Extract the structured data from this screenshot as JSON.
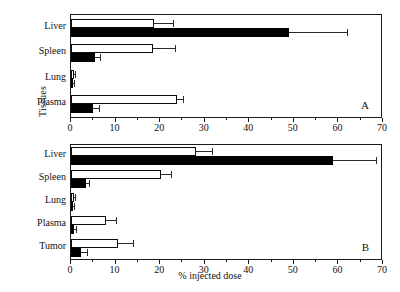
{
  "chart_data": {
    "type": "bar",
    "orientation": "horizontal",
    "title": "",
    "xlabel": "% injected dose",
    "ylabel": "Tissues",
    "xlim": [
      0,
      70
    ],
    "xticks": [
      0,
      10,
      20,
      30,
      40,
      50,
      60,
      70
    ],
    "xtick_labels": [
      "0",
      "10",
      "20",
      "30",
      "40",
      "50",
      "60",
      "70"
    ],
    "grid": false,
    "legend": null,
    "panels": [
      {
        "letter": "A",
        "categories": [
          "Liver",
          "Spleen",
          "Lung",
          "Plasma"
        ],
        "series": [
          {
            "name": "open",
            "style": "open",
            "values": [
              18.6,
              18.3,
              0.7,
              23.7
            ],
            "errors": [
              4.3,
              5.0,
              0.3,
              1.4
            ]
          },
          {
            "name": "filled",
            "style": "filled",
            "values": [
              49.0,
              5.3,
              0.3,
              5.0
            ],
            "errors": [
              13.0,
              1.3,
              0.2,
              1.2
            ]
          }
        ]
      },
      {
        "letter": "B",
        "categories": [
          "Liver",
          "Spleen",
          "Lung",
          "Plasma",
          "Tumor"
        ],
        "series": [
          {
            "name": "open",
            "style": "open",
            "values": [
              28.0,
              20.1,
              0.6,
              7.8,
              10.5
            ],
            "errors": [
              3.6,
              2.4,
              0.3,
              2.2,
              3.5
            ]
          },
          {
            "name": "filled",
            "style": "filled",
            "values": [
              58.7,
              3.4,
              0.4,
              0.7,
              2.3
            ],
            "errors": [
              9.8,
              0.6,
              0.2,
              0.5,
              1.2
            ]
          }
        ]
      }
    ]
  }
}
